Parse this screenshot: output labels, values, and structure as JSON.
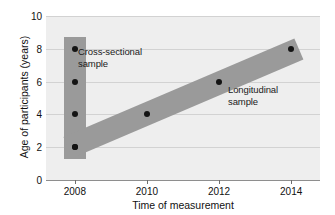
{
  "chart_data": {
    "type": "scatter",
    "title": "",
    "xlabel": "Time of measurement",
    "ylabel": "Age of participants (years)",
    "xlim": [
      2007.2,
      2014.8
    ],
    "ylim": [
      0,
      10
    ],
    "grid": true,
    "legend_position": "none",
    "x_ticks": [
      "2008",
      "2010",
      "2012",
      "2014"
    ],
    "x_tick_values": [
      2008,
      2010,
      2012,
      2014
    ],
    "y_ticks": [
      "0",
      "2",
      "4",
      "6",
      "8",
      "10"
    ],
    "y_tick_values": [
      0,
      2,
      4,
      6,
      8,
      10
    ],
    "series": [
      {
        "name": "Cross-sectional sample",
        "x": [
          2008,
          2008,
          2008,
          2008
        ],
        "values": [
          2,
          4,
          6,
          8
        ],
        "band": {
          "orientation": "vertical",
          "x_center": 2008,
          "x_width_years": 0.62,
          "y_from": 1.3,
          "y_to": 8.7
        }
      },
      {
        "name": "Longitudinal sample",
        "x": [
          2008,
          2010,
          2012,
          2014
        ],
        "values": [
          2,
          4,
          6,
          8
        ],
        "band": {
          "orientation": "diagonal",
          "x_from": 2007.8,
          "x_to": 2014.2,
          "y_from": 2,
          "y_to": 8,
          "thickness_years_age": 1.4
        }
      }
    ],
    "annotations": [
      {
        "text_line1": "Cross-sectional",
        "text_line2": "sample",
        "x": 2008.6,
        "y": 7.1
      },
      {
        "text_line1": "Longitudinal",
        "text_line2": "sample",
        "x": 2012.6,
        "y": 5.2
      }
    ],
    "colors": {
      "plot_background": "#eeeeee",
      "gridline": "#d2d2d2",
      "band": "#9a9a9a",
      "point": "#141414",
      "axis": "#8e8e8e",
      "text": "#111111"
    }
  }
}
